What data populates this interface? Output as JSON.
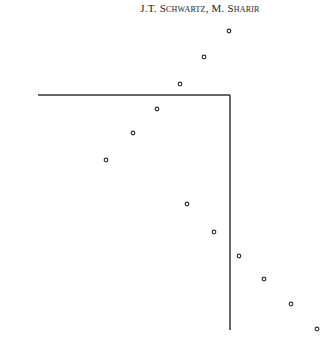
{
  "header": {
    "running_head": "J.T. Schwartz, M. Sharir"
  },
  "figure": {
    "points": [
      {
        "x": 229,
        "y": 31
      },
      {
        "x": 204,
        "y": 57
      },
      {
        "x": 180,
        "y": 84
      },
      {
        "x": 157,
        "y": 109
      },
      {
        "x": 133,
        "y": 133
      },
      {
        "x": 106,
        "y": 160
      },
      {
        "x": 187,
        "y": 204
      },
      {
        "x": 214,
        "y": 232
      },
      {
        "x": 239,
        "y": 256
      },
      {
        "x": 264,
        "y": 279
      },
      {
        "x": 291,
        "y": 304
      },
      {
        "x": 317,
        "y": 329
      }
    ],
    "boundary": {
      "corner": {
        "x": 230,
        "y": 95
      },
      "left_end_x": 38,
      "bottom_end_y": 330
    },
    "ink_color": "#333333"
  }
}
